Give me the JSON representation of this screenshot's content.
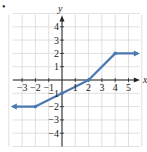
{
  "chart_data": {
    "type": "line",
    "title": "",
    "xlabel": "x",
    "ylabel": "y",
    "xlim": [
      -4,
      6
    ],
    "ylim": [
      -5,
      5
    ],
    "grid": true,
    "x_ticks": [
      -3,
      -2,
      -1,
      1,
      2,
      3,
      4,
      5
    ],
    "y_ticks": [
      -4,
      -3,
      -2,
      -1,
      1,
      2,
      3,
      4
    ],
    "series": [
      {
        "name": "piecewise function",
        "color": "#4a78b0",
        "points": [
          {
            "x": -4,
            "y": -2,
            "arrow": true
          },
          {
            "x": -2,
            "y": -2,
            "marker": true
          },
          {
            "x": 0,
            "y": -1,
            "marker": true
          },
          {
            "x": 1,
            "y": -0.5
          },
          {
            "x": 2,
            "y": 0,
            "marker": true
          },
          {
            "x": 4,
            "y": 2,
            "marker": true
          },
          {
            "x": 6,
            "y": 2,
            "arrow": true
          }
        ]
      }
    ]
  },
  "labels": {
    "x_axis": "x",
    "y_axis": "y",
    "bullet": "•",
    "x_ticks": [
      "−3",
      "−2",
      "−1",
      "1",
      "2",
      "3",
      "4",
      "5"
    ],
    "y_ticks": [
      "4",
      "3",
      "2",
      "1",
      "−1",
      "−2",
      "−3",
      "−4"
    ]
  },
  "colors": {
    "curve": "#4a78b0",
    "grid": "#d8d8d8",
    "axis": "#222222"
  }
}
